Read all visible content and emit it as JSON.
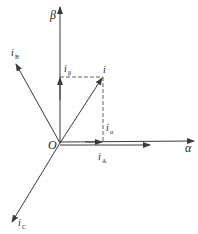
{
  "diagram": {
    "type": "vector-diagram",
    "origin_label": "O",
    "axes": {
      "alpha": {
        "label": "α"
      },
      "beta": {
        "label": "β"
      }
    },
    "vectors": {
      "i": {
        "label": "i"
      },
      "iA": {
        "label": "i",
        "sub": "A"
      },
      "iB": {
        "label": "i",
        "sub": "B"
      },
      "iC": {
        "label": "i",
        "sub": "C"
      },
      "ialpha": {
        "label": "i",
        "sub": "α"
      },
      "ibeta": {
        "label": "i",
        "sub": "β"
      }
    },
    "colors": {
      "line": "#3a3a3a",
      "background": "#ffffff"
    }
  }
}
